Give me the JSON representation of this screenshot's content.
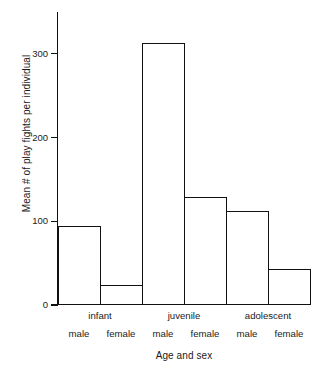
{
  "chart_data": {
    "type": "bar",
    "title": "",
    "xlabel": "Age and sex",
    "ylabel": "Mean # of play fights per individual",
    "categories": [
      "infant male",
      "infant female",
      "juvenile male",
      "juvenile female",
      "adolescent male",
      "adolescent female"
    ],
    "values": [
      93,
      22,
      312,
      128,
      111,
      41
    ],
    "groups": [
      {
        "label": "infant",
        "sexes": [
          "male",
          "female"
        ]
      },
      {
        "label": "juvenile",
        "sexes": [
          "male",
          "female"
        ]
      },
      {
        "label": "adolescent",
        "sexes": [
          "male",
          "female"
        ]
      }
    ],
    "ylim": [
      0,
      350
    ],
    "yticks": [
      0,
      100,
      200,
      300
    ],
    "ytick_labels": [
      "0",
      "100",
      "200",
      "300"
    ],
    "grid": false,
    "legend": "none",
    "bar_fill": "#ffffff",
    "bar_stroke": "#111111",
    "axis_color": "#111111"
  },
  "figure": {
    "background": "#ffffff",
    "caption_fragment": ""
  }
}
